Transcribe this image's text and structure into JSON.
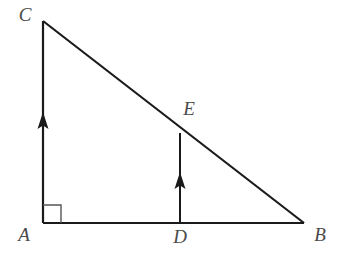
{
  "figure": {
    "kind": "geometry-diagram",
    "background_color": "#ffffff",
    "stroke_color": "#1a1a1a",
    "label_color": "#4a4a4a",
    "right_angle_color": "#555555",
    "canvas": {
      "width": 343,
      "height": 268
    }
  },
  "points": {
    "A": {
      "label": "A",
      "x": 43,
      "y": 223,
      "label_x": 24,
      "label_y": 237
    },
    "B": {
      "label": "B",
      "x": 304,
      "y": 223,
      "label_x": 320,
      "label_y": 237
    },
    "C": {
      "label": "C",
      "x": 43,
      "y": 21,
      "label_x": 25,
      "label_y": 17
    },
    "D": {
      "label": "D",
      "x": 180,
      "y": 223,
      "label_x": 180,
      "label_y": 239
    },
    "E": {
      "label": "E",
      "x": 180,
      "y": 133,
      "label_x": 189,
      "label_y": 111
    }
  },
  "segments": {
    "AC": {
      "name": "AC",
      "x1": 43,
      "y1": 223,
      "x2": 43,
      "y2": 21,
      "width": 2.2,
      "arrow": "up",
      "arrow_y": 128
    },
    "AB": {
      "name": "AB",
      "x1": 43,
      "y1": 223,
      "x2": 304,
      "y2": 223,
      "width": 2.2
    },
    "CB": {
      "name": "CB",
      "x1": 43,
      "y1": 21,
      "x2": 304,
      "y2": 223,
      "width": 2.2
    },
    "DE": {
      "name": "DE",
      "x1": 180,
      "y1": 223,
      "x2": 180,
      "y2": 133,
      "width": 2.0,
      "arrow": "up",
      "arrow_y": 188
    }
  },
  "right_angle": {
    "at": "A",
    "size": 18,
    "path": "M 43 205 L 61 205 L 61 223"
  },
  "arrow_marks": {
    "ac_arrow": {
      "tip_x": 43,
      "tip_y": 112,
      "half_width": 5.5,
      "height": 17
    },
    "de_arrow": {
      "tip_x": 180,
      "tip_y": 172,
      "half_width": 5.5,
      "height": 17
    }
  },
  "chart_data": {
    "type": "diagram",
    "vertices": [
      {
        "name": "A",
        "x": 43,
        "y": 223
      },
      {
        "name": "B",
        "x": 304,
        "y": 223
      },
      {
        "name": "C",
        "x": 43,
        "y": 21
      },
      {
        "name": "D",
        "x": 180,
        "y": 223
      },
      {
        "name": "E",
        "x": 180,
        "y": 133
      }
    ],
    "edges": [
      {
        "from": "A",
        "to": "C"
      },
      {
        "from": "A",
        "to": "B"
      },
      {
        "from": "C",
        "to": "B"
      },
      {
        "from": "D",
        "to": "E"
      }
    ],
    "annotations": [
      {
        "type": "right-angle",
        "at": "A",
        "between": [
          "AB",
          "AC"
        ]
      },
      {
        "type": "parallel-arrow",
        "on": "AC",
        "direction": "up"
      },
      {
        "type": "parallel-arrow",
        "on": "DE",
        "direction": "up"
      }
    ]
  }
}
